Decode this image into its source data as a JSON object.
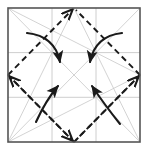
{
  "figure": {
    "type": "origami-crease-pattern",
    "title": "",
    "caption": "",
    "canvas": {
      "width": 148,
      "height": 151,
      "background": "#ffffff"
    }
  },
  "colors": {
    "sheet_border": "#555555",
    "grid_line": "#c8c8c8",
    "guide_diagonal": "#c8c8c8",
    "fold_dashed": "#1a1a1a",
    "motion_arrow": "#1a1a1a",
    "background": "#ffffff"
  },
  "sheet": {
    "name": "paper-square",
    "x": 8,
    "y": 8,
    "width": 132,
    "height": 134,
    "stroke_width": 1.6
  },
  "grid": {
    "label": "third-division-grid",
    "vertical_x": [
      52,
      96
    ],
    "horizontal_y": [
      52.6,
      97.3
    ],
    "stroke_width": 0.9
  },
  "guides": {
    "label": "guide-diagonals",
    "stroke_width": 0.8,
    "segments": [
      {
        "name": "main-diagonal-tl-br",
        "x1": 8,
        "y1": 8,
        "x2": 140,
        "y2": 142
      },
      {
        "name": "main-diagonal-tr-bl",
        "x1": 140,
        "y1": 8,
        "x2": 8,
        "y2": 142
      },
      {
        "name": "corner-tl-to-right-mid",
        "x1": 8,
        "y1": 8,
        "x2": 140,
        "y2": 75
      },
      {
        "name": "corner-bl-to-right-mid",
        "x1": 8,
        "y1": 142,
        "x2": 140,
        "y2": 75
      },
      {
        "name": "corner-bl-to-top-mid",
        "x1": 8,
        "y1": 142,
        "x2": 74,
        "y2": 8
      },
      {
        "name": "corner-br-to-top-mid",
        "x1": 140,
        "y1": 142,
        "x2": 74,
        "y2": 8
      }
    ]
  },
  "diamond": {
    "label": "dashed-fold-diamond",
    "dash_pattern": "6 4",
    "stroke_width": 1.9,
    "vertices": [
      {
        "name": "top-vertex",
        "x": 74,
        "y": 8
      },
      {
        "name": "right-vertex",
        "x": 140,
        "y": 75
      },
      {
        "name": "bottom-vertex",
        "x": 74,
        "y": 142
      },
      {
        "name": "left-vertex",
        "x": 8,
        "y": 75
      }
    ],
    "vertex_arrowheads": [
      "top-vertex",
      "right-vertex",
      "bottom-vertex",
      "left-vertex"
    ]
  },
  "motion_arrows": {
    "label": "fold-motion-arrows",
    "count": 4,
    "stroke_width": 2.1,
    "items": [
      {
        "name": "arrow-top-left-inward",
        "direction": "down-right",
        "start": {
          "x": 27,
          "y": 33
        },
        "control": {
          "x": 55,
          "y": 36
        },
        "end": {
          "x": 60,
          "y": 62
        }
      },
      {
        "name": "arrow-top-right-inward",
        "direction": "down-left",
        "start": {
          "x": 122,
          "y": 33
        },
        "control": {
          "x": 95,
          "y": 36
        },
        "end": {
          "x": 90,
          "y": 62
        }
      },
      {
        "name": "arrow-bottom-left-inward",
        "direction": "up-right",
        "start": {
          "x": 36,
          "y": 122
        },
        "control": {
          "x": 46,
          "y": 100
        },
        "end": {
          "x": 58,
          "y": 86
        }
      },
      {
        "name": "arrow-bottom-right-inward",
        "direction": "up-left",
        "start": {
          "x": 120,
          "y": 124
        },
        "control": {
          "x": 104,
          "y": 104
        },
        "end": {
          "x": 92,
          "y": 86
        }
      }
    ]
  }
}
